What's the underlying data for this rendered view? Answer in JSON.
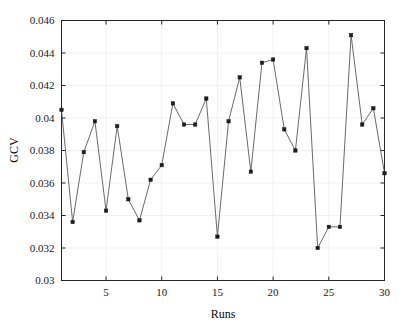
{
  "chart_data": {
    "type": "line",
    "title": "",
    "xlabel": "Runs",
    "ylabel": "GCV",
    "xlim": [
      1,
      30
    ],
    "ylim": [
      0.03,
      0.046
    ],
    "grid": true,
    "legend": null,
    "marker": "filled-square",
    "line_color": "#595959",
    "marker_color": "#1c1c1c",
    "xticks": [
      5,
      10,
      15,
      20,
      25,
      30
    ],
    "xtick_labels": [
      "5",
      "10",
      "15",
      "20",
      "25",
      "30"
    ],
    "yticks": [
      0.03,
      0.032,
      0.034,
      0.036,
      0.038,
      0.04,
      0.042,
      0.044,
      0.046
    ],
    "ytick_labels": [
      "0.03",
      "0.032",
      "0.034",
      "0.036",
      "0.038",
      "0.04",
      "0.042",
      "0.044",
      "0.046"
    ],
    "x": [
      1,
      2,
      3,
      4,
      5,
      6,
      7,
      8,
      9,
      10,
      11,
      12,
      13,
      14,
      15,
      16,
      17,
      18,
      19,
      20,
      21,
      22,
      23,
      24,
      25,
      26,
      27,
      28,
      29,
      30
    ],
    "series": [
      {
        "name": "GCV",
        "values": [
          0.0405,
          0.0336,
          0.0379,
          0.0398,
          0.0343,
          0.0395,
          0.035,
          0.0337,
          0.0362,
          0.0371,
          0.0409,
          0.0396,
          0.0396,
          0.0412,
          0.0327,
          0.0398,
          0.0425,
          0.0367,
          0.0434,
          0.0436,
          0.0393,
          0.038,
          0.0443,
          0.032,
          0.0333,
          0.0333,
          0.0451,
          0.0396,
          0.0406,
          0.0366
        ]
      }
    ]
  },
  "axes": {
    "y_title": "GCV",
    "x_title": "Runs"
  }
}
